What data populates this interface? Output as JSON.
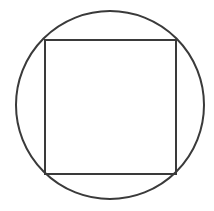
{
  "diagram": {
    "title": "",
    "stroke_color": "#3a3a3a",
    "background": "#ffffff",
    "circle": {
      "cx": 110,
      "cy": 105,
      "r": 94
    },
    "square": {
      "x": 45,
      "y": 40,
      "width": 131,
      "height": 134
    }
  }
}
